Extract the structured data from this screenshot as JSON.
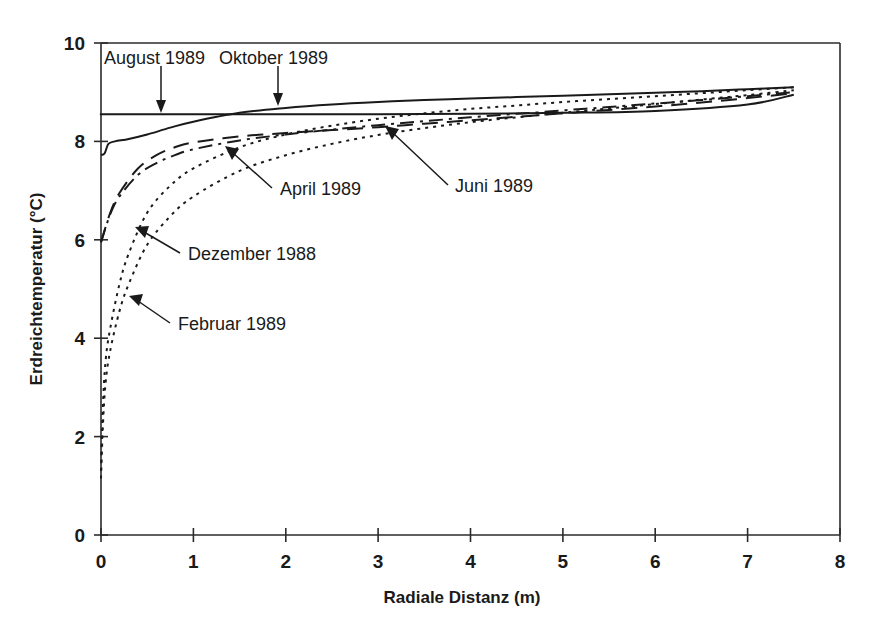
{
  "chart_data": {
    "type": "line",
    "title": "",
    "xlabel": "Radiale Distanz (m)",
    "ylabel": "Erdreichtemperatur (°C)",
    "xlim": [
      0,
      8
    ],
    "ylim": [
      0,
      10
    ],
    "xticks": [
      "0",
      "1",
      "2",
      "3",
      "4",
      "5",
      "6",
      "7",
      "8"
    ],
    "yticks": [
      "0",
      "2",
      "4",
      "6",
      "8",
      "10"
    ],
    "grid": false,
    "legend_position": "inline-annotations",
    "series": [
      {
        "name": "August 1989",
        "style": "solid",
        "x": [
          0.0,
          0.05,
          0.5,
          1.0,
          2.0,
          3.0,
          4.0,
          5.0,
          6.0,
          7.0,
          7.5
        ],
        "values": [
          8.55,
          8.55,
          8.55,
          8.55,
          8.55,
          8.55,
          8.56,
          8.58,
          8.62,
          8.75,
          8.95
        ]
      },
      {
        "name": "Oktober 1989",
        "style": "solid",
        "x": [
          0.0,
          0.04,
          0.08,
          0.15,
          0.3,
          0.5,
          0.75,
          1.0,
          1.5,
          2.0,
          2.5,
          3.0,
          3.5,
          4.0,
          4.5,
          5.0,
          5.5,
          6.0,
          6.5,
          7.0,
          7.5
        ],
        "values": [
          7.72,
          7.76,
          7.95,
          8.0,
          8.05,
          8.14,
          8.28,
          8.4,
          8.58,
          8.68,
          8.75,
          8.8,
          8.84,
          8.87,
          8.9,
          8.93,
          8.96,
          8.99,
          9.02,
          9.06,
          9.1
        ]
      },
      {
        "name": "April 1989",
        "style": "long-dash",
        "x": [
          0.0,
          0.1,
          0.2,
          0.4,
          0.6,
          0.8,
          1.0,
          1.5,
          2.0,
          2.5,
          3.0,
          3.5,
          4.0,
          4.5,
          5.0,
          5.5,
          6.0,
          6.5,
          7.0,
          7.5
        ],
        "values": [
          5.95,
          6.55,
          6.95,
          7.45,
          7.72,
          7.88,
          7.98,
          8.1,
          8.17,
          8.23,
          8.29,
          8.36,
          8.43,
          8.5,
          8.57,
          8.64,
          8.71,
          8.79,
          8.88,
          8.98
        ]
      },
      {
        "name": "Juni 1989",
        "style": "dash-dot",
        "x": [
          0.0,
          0.1,
          0.2,
          0.4,
          0.6,
          0.8,
          1.0,
          1.5,
          2.0,
          2.5,
          3.0,
          3.5,
          4.0,
          4.5,
          5.0,
          5.5,
          6.0,
          6.5,
          7.0,
          7.5
        ],
        "values": [
          5.95,
          6.52,
          6.88,
          7.32,
          7.56,
          7.72,
          7.84,
          8.02,
          8.14,
          8.24,
          8.33,
          8.41,
          8.49,
          8.56,
          8.63,
          8.7,
          8.77,
          8.84,
          8.92,
          9.0
        ]
      },
      {
        "name": "Dezember 1988",
        "style": "dotted",
        "x": [
          0.0,
          0.02,
          0.05,
          0.1,
          0.2,
          0.3,
          0.5,
          0.75,
          1.0,
          1.5,
          2.0,
          2.5,
          3.0,
          3.5,
          4.0,
          4.5,
          5.0,
          5.5,
          6.0,
          6.5,
          7.0,
          7.5
        ],
        "values": [
          1.3,
          2.6,
          3.55,
          4.2,
          5.1,
          5.72,
          6.55,
          7.1,
          7.45,
          7.88,
          8.14,
          8.32,
          8.46,
          8.57,
          8.66,
          8.73,
          8.8,
          8.86,
          8.92,
          8.98,
          9.04,
          9.1
        ]
      },
      {
        "name": "Februar 1989",
        "style": "dotted",
        "x": [
          0.0,
          0.02,
          0.05,
          0.1,
          0.2,
          0.3,
          0.5,
          0.75,
          1.0,
          1.5,
          2.0,
          2.5,
          3.0,
          3.5,
          4.0,
          4.5,
          5.0,
          5.5,
          6.0,
          6.5,
          7.0,
          7.5
        ],
        "values": [
          1.15,
          2.2,
          3.1,
          3.75,
          4.55,
          5.1,
          5.9,
          6.48,
          6.88,
          7.4,
          7.72,
          7.95,
          8.13,
          8.27,
          8.39,
          8.49,
          8.58,
          8.67,
          8.76,
          8.85,
          8.94,
          9.04
        ]
      }
    ],
    "annotations": [
      {
        "text": "August 1989",
        "series": "August 1989",
        "point": [
          0.65,
          8.55
        ]
      },
      {
        "text": "Oktober 1989",
        "series": "Oktober 1989",
        "point": [
          2.0,
          8.68
        ]
      },
      {
        "text": "Juni 1989",
        "series": "Juni 1989",
        "point": [
          3.05,
          8.35
        ]
      },
      {
        "text": "April 1989",
        "series": "April 1989",
        "point": [
          1.95,
          8.17
        ]
      },
      {
        "text": "Dezember 1988",
        "series": "Dezember 1988",
        "point": [
          0.3,
          6.05
        ]
      },
      {
        "text": "Februar 1989",
        "series": "Februar 1989",
        "point": [
          0.3,
          4.82
        ]
      }
    ]
  },
  "axes": {
    "x_title": "Radiale Distanz (m)",
    "y_title": "Erdreichtemperatur (°C)",
    "x_tick_labels": [
      "0",
      "1",
      "2",
      "3",
      "4",
      "5",
      "6",
      "7",
      "8"
    ],
    "y_tick_labels": [
      "0",
      "2",
      "4",
      "6",
      "8",
      "10"
    ]
  },
  "annotation_labels": {
    "august": "August 1989",
    "oktober": "Oktober 1989",
    "juni": "Juni 1989",
    "april": "April 1989",
    "dezember": "Dezember 1988",
    "februar": "Februar 1989"
  },
  "colors": {
    "ink": "#1a1a1a",
    "axis": "#2b2b2b",
    "background": "#ffffff"
  }
}
